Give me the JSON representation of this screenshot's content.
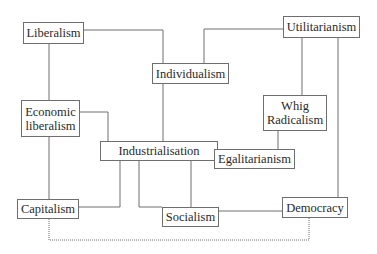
{
  "diagram": {
    "type": "concept-map",
    "nodes": {
      "liberalism": {
        "label": "Liberalism"
      },
      "individualism": {
        "label": "Individualism"
      },
      "utilitarianism": {
        "label": "Utilitarianism"
      },
      "economic_liberalism": {
        "line1": "Economic",
        "line2": "liberalism"
      },
      "whig_radicalism": {
        "line1": "Whig",
        "line2": "Radicalism"
      },
      "industrialisation": {
        "label": "Industrialisation"
      },
      "egalitarianism": {
        "label": "Egalitarianism"
      },
      "capitalism": {
        "label": "Capitalism"
      },
      "socialism": {
        "label": "Socialism"
      },
      "democracy": {
        "label": "Democracy"
      }
    },
    "edges": [
      {
        "from": "Liberalism",
        "to": "Individualism",
        "style": "solid"
      },
      {
        "from": "Liberalism",
        "to": "Economic liberalism",
        "style": "solid"
      },
      {
        "from": "Utilitarianism",
        "to": "Individualism",
        "style": "solid"
      },
      {
        "from": "Utilitarianism",
        "to": "Whig Radicalism",
        "style": "solid"
      },
      {
        "from": "Utilitarianism",
        "to": "Democracy",
        "style": "solid"
      },
      {
        "from": "Individualism",
        "to": "Industrialisation",
        "style": "solid"
      },
      {
        "from": "Economic liberalism",
        "to": "Industrialisation",
        "style": "solid"
      },
      {
        "from": "Economic liberalism",
        "to": "Capitalism",
        "style": "solid"
      },
      {
        "from": "Whig Radicalism",
        "to": "Egalitarianism",
        "style": "solid"
      },
      {
        "from": "Egalitarianism",
        "to": "Socialism",
        "style": "solid"
      },
      {
        "from": "Industrialisation",
        "to": "Capitalism",
        "style": "solid"
      },
      {
        "from": "Industrialisation",
        "to": "Socialism",
        "style": "solid"
      },
      {
        "from": "Socialism",
        "to": "Democracy",
        "style": "solid"
      },
      {
        "from": "Capitalism",
        "to": "Democracy",
        "style": "dotted"
      }
    ],
    "colors": {
      "line": "#6e6e6e",
      "text": "#2a2a2a",
      "background": "#ffffff"
    }
  }
}
